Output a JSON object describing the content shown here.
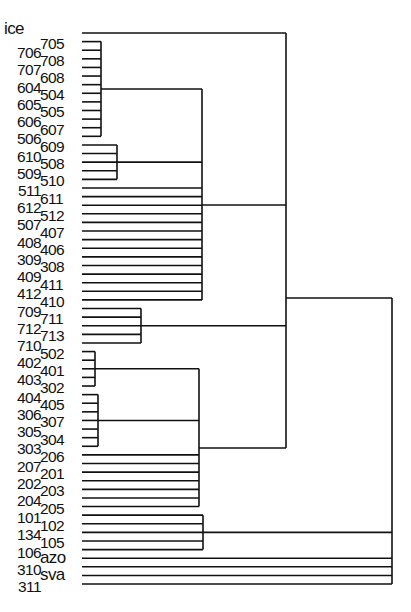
{
  "diagram": {
    "type": "dendrogram",
    "orientation": "left-to-right",
    "line_color": "#111111",
    "leaf_start_y": 33,
    "leaf_spacing": 8.61,
    "leaf_line_x": 82,
    "leaves": [
      "ice",
      "705",
      "706",
      "708",
      "707",
      "608",
      "604",
      "504",
      "605",
      "505",
      "606",
      "607",
      "506",
      "609",
      "610",
      "508",
      "509",
      "510",
      "511",
      "611",
      "612",
      "512",
      "507",
      "407",
      "408",
      "406",
      "309",
      "308",
      "409",
      "411",
      "412",
      "410",
      "709",
      "711",
      "712",
      "713",
      "710",
      "502",
      "402",
      "401",
      "403",
      "302",
      "404",
      "405",
      "306",
      "307",
      "305",
      "304",
      "303",
      "206",
      "207",
      "201",
      "202",
      "203",
      "204",
      "205",
      "101",
      "102",
      "134",
      "105",
      "106",
      "azo",
      "310",
      "sva",
      "311"
    ],
    "clusters": [
      {
        "id": "g1",
        "leaves": [
          1,
          12
        ],
        "x": 101,
        "parent_x": 202
      },
      {
        "id": "g2",
        "leaves": [
          13,
          17
        ],
        "x": 117,
        "parent_x": 202
      },
      {
        "id": "g3",
        "leaves": [
          32,
          36
        ],
        "x": 141,
        "parent_x": 286
      },
      {
        "id": "g4",
        "leaves": [
          37,
          41
        ],
        "x": 95,
        "parent_x": 199
      },
      {
        "id": "g5",
        "leaves": [
          42,
          48
        ],
        "x": 98,
        "parent_x": 199
      },
      {
        "id": "g6",
        "leaves": [
          56,
          60
        ],
        "x": 203,
        "parent_x": 392
      }
    ],
    "upper_bracket": {
      "x": 202,
      "direct_leaves": [
        18,
        31
      ],
      "join_y": 205,
      "parent_x": 286
    },
    "lower_bracket": {
      "x": 199,
      "direct_leaves": [
        49,
        55
      ],
      "join_y": 448,
      "parent_x": 286
    },
    "main_bracket": {
      "x": 286,
      "top_leaf": 0,
      "bottom_y": 448,
      "join_y": 298,
      "parent_x": 392
    },
    "root_bracket": {
      "x": 392,
      "top_y": 298,
      "direct_leaves": [
        61,
        64
      ]
    }
  }
}
